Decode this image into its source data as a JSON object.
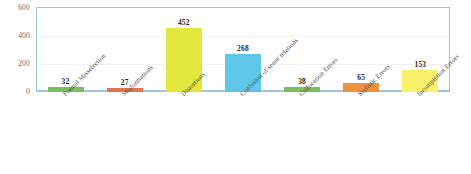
{
  "chart_data": {
    "type": "bar",
    "title": "",
    "xlabel": "",
    "ylabel": "",
    "ylim": [
      0,
      600
    ],
    "yticks": [
      "0",
      "200",
      "400",
      "600"
    ],
    "grid": true,
    "legend": "none",
    "categories": [
      "Formal Misselection",
      "Misformations",
      "Distortions",
      "Confusion of sense relations",
      "Collocation Errors",
      "Stylistic Errors",
      "Incompletion Errors"
    ],
    "values": [
      32,
      27,
      452,
      268,
      38,
      65,
      153
    ],
    "value_labels": [
      "32",
      "27",
      "452",
      "268",
      "38",
      "65",
      "153"
    ],
    "bar_colors": [
      "#7CBF5A",
      "#E8714A",
      "#E3E63C",
      "#5EC7E8",
      "#7CBF5A",
      "#F0913F",
      "#FBF06A"
    ]
  },
  "style": {
    "plot_border_color": "#9ec4e0",
    "gridline_color": "#f0f0f0",
    "axis_text_color": "#6b6b6b",
    "value_text_color": "#2a2a2a",
    "background": "#ffffff"
  }
}
